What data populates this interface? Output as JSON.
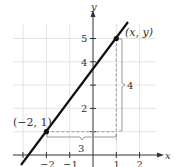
{
  "diagram": {
    "type": "coordinate-graph",
    "axes": {
      "x_label": "x",
      "y_label": "y",
      "x_ticks": [
        "−2",
        "−1",
        "1",
        "2"
      ],
      "y_ticks": [
        "2",
        "4",
        "5"
      ]
    },
    "points": [
      {
        "label": "(−2, 1)",
        "x": -2,
        "y": 1
      },
      {
        "label": "(x, y)",
        "x": 1,
        "y": 5
      }
    ],
    "line": {
      "passes_through": [
        [
          -2,
          1
        ],
        [
          1,
          5
        ]
      ],
      "color": "#111111"
    },
    "run_label": "3",
    "rise_label": "4",
    "colors": {
      "grid": "#e3e3e3",
      "axes": "#333333",
      "dashed": "#999999",
      "brace": "#9a9a9a"
    }
  }
}
